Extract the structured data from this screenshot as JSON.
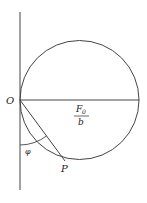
{
  "diagram": {
    "type": "geometry",
    "labels": {
      "origin": "O",
      "point": "P",
      "angle": "φ",
      "diameter_numerator": "F",
      "diameter_numerator_sub": "0",
      "diameter_denominator": "b"
    },
    "colors": {
      "stroke": "#333333",
      "background": "#ffffff"
    }
  }
}
